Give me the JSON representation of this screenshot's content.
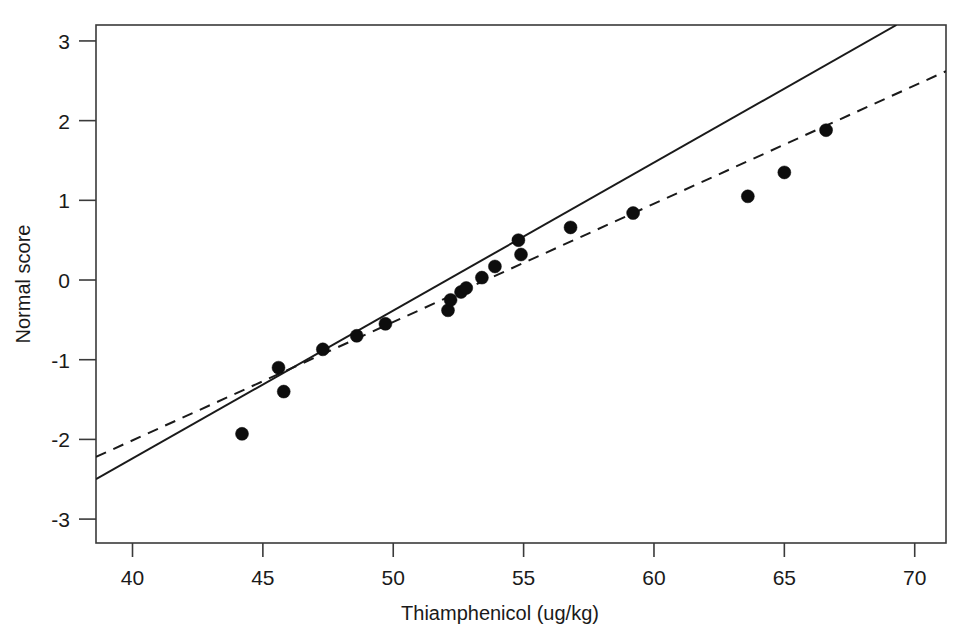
{
  "chart_data": {
    "type": "scatter",
    "title": "",
    "xlabel": "Thiamphenicol (ug/kg)",
    "ylabel": "Normal score",
    "xlim": [
      38.6,
      71.2
    ],
    "ylim": [
      -3.3,
      3.2
    ],
    "grid": false,
    "legend": "none",
    "xticks": [
      40,
      45,
      50,
      55,
      60,
      65,
      70
    ],
    "xtick_labels": [
      "40",
      "45",
      "50",
      "55",
      "60",
      "65",
      "70"
    ],
    "yticks": [
      3,
      2,
      1,
      0,
      -1,
      -2,
      -3
    ],
    "ytick_labels": [
      "3",
      "2",
      "1",
      "0",
      "-1",
      "-2",
      "-3"
    ],
    "points": [
      {
        "x": 44.2,
        "y": -1.93
      },
      {
        "x": 45.6,
        "y": -1.1
      },
      {
        "x": 45.8,
        "y": -1.4
      },
      {
        "x": 47.3,
        "y": -0.87
      },
      {
        "x": 48.6,
        "y": -0.7
      },
      {
        "x": 49.7,
        "y": -0.55
      },
      {
        "x": 52.1,
        "y": -0.38
      },
      {
        "x": 52.2,
        "y": -0.25
      },
      {
        "x": 52.6,
        "y": -0.15
      },
      {
        "x": 52.8,
        "y": -0.1
      },
      {
        "x": 53.4,
        "y": 0.03
      },
      {
        "x": 53.9,
        "y": 0.17
      },
      {
        "x": 54.8,
        "y": 0.5
      },
      {
        "x": 54.9,
        "y": 0.32
      },
      {
        "x": 56.8,
        "y": 0.66
      },
      {
        "x": 59.2,
        "y": 0.84
      },
      {
        "x": 63.6,
        "y": 1.05
      },
      {
        "x": 65.0,
        "y": 1.35
      },
      {
        "x": 66.6,
        "y": 1.88
      }
    ],
    "series": [
      {
        "name": "solid-reference-line",
        "style": "solid",
        "endpoints": [
          {
            "x": 38.6,
            "y": -2.5
          },
          {
            "x": 69.3,
            "y": 3.2
          }
        ]
      },
      {
        "name": "dashed-fitted-line",
        "style": "dashed",
        "endpoints": [
          {
            "x": 38.6,
            "y": -2.22
          },
          {
            "x": 71.2,
            "y": 2.62
          }
        ]
      }
    ],
    "marker": {
      "shape": "circle",
      "color": "#0d0d0d",
      "size_px": 13
    }
  },
  "figure": {
    "background": "#ffffff",
    "frame_color": "#3a3a3a",
    "text_color": "#1a1a1a"
  }
}
